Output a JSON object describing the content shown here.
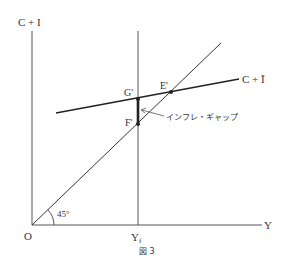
{
  "diagram": {
    "caption": "図 3",
    "y_axis_label": "C + I",
    "x_axis_label": "Y",
    "origin_label": "O",
    "angle_label": "45°",
    "full_employment_label": "Y",
    "full_employment_subscript": "f",
    "aggregate_demand_label": "C + Ī",
    "points": {
      "G": "G'",
      "E": "E'",
      "F": "F'"
    },
    "annotation": "インフレ・ギャップ",
    "colors": {
      "line": "#2a2a2a",
      "thin_line": "#555555",
      "text": "#333333",
      "background": "#ffffff"
    }
  }
}
